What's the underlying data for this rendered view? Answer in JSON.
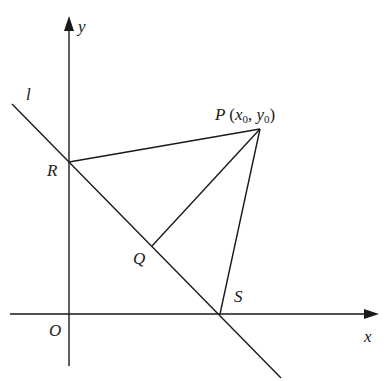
{
  "diagram": {
    "type": "coordinate-geometry",
    "axes": {
      "x_label": "x",
      "y_label": "y",
      "origin_label": "O"
    },
    "line": {
      "label": "l"
    },
    "points": {
      "P": {
        "label": "P",
        "coords_text_x": "x",
        "coords_sub_x": "0",
        "coords_text_y": "y",
        "coords_sub_y": "0",
        "open": "(",
        "sep": ",",
        "close": ")"
      },
      "R": {
        "label": "R"
      },
      "Q": {
        "label": "Q"
      },
      "S": {
        "label": "S"
      }
    },
    "segments": [
      "PR",
      "PQ",
      "PS"
    ],
    "stroke_color": "#1a1a1a",
    "background": "#ffffff"
  }
}
